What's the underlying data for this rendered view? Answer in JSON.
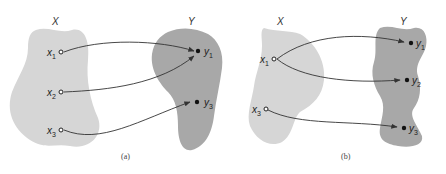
{
  "colors": {
    "domain_fill": "#d6d6d6",
    "codomain_fill": "#a8a8a8",
    "stroke": "#333333",
    "background": "#ffffff"
  },
  "panels": [
    {
      "caption": "(a)",
      "domain": {
        "label": "X",
        "elements": [
          {
            "name": "x",
            "sub": "1"
          },
          {
            "name": "x",
            "sub": "2"
          },
          {
            "name": "x",
            "sub": "3"
          }
        ]
      },
      "codomain": {
        "label": "Y",
        "elements": [
          {
            "name": "y",
            "sub": "1"
          },
          {
            "name": "y",
            "sub": "3"
          }
        ]
      },
      "mappings": [
        {
          "from": "x1",
          "to": "y1"
        },
        {
          "from": "x2",
          "to": "y1"
        },
        {
          "from": "x3",
          "to": "y3"
        }
      ]
    },
    {
      "caption": "(b)",
      "domain": {
        "label": "X",
        "elements": [
          {
            "name": "x",
            "sub": "1"
          },
          {
            "name": "x",
            "sub": "3"
          }
        ]
      },
      "codomain": {
        "label": "Y",
        "elements": [
          {
            "name": "y",
            "sub": "1"
          },
          {
            "name": "y",
            "sub": "2"
          },
          {
            "name": "y",
            "sub": "3"
          }
        ]
      },
      "mappings": [
        {
          "from": "x1",
          "to": "y1"
        },
        {
          "from": "x1",
          "to": "y2"
        },
        {
          "from": "x3",
          "to": "y3"
        }
      ]
    }
  ]
}
